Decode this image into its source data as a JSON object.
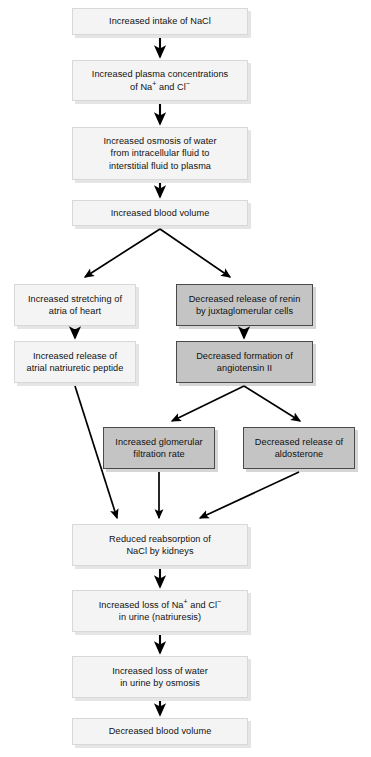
{
  "diagram": {
    "type": "flowchart",
    "canvas": {
      "width": 371,
      "height": 757
    },
    "style": {
      "light_fill": "#f4f4f4",
      "light_border": "#d8d8d8",
      "shaded_fill": "#c4c4c4",
      "shaded_border": "#4a4a4a",
      "arrow_color": "#000000",
      "text_color": "#111111",
      "background": "#ffffff"
    },
    "nodes": [
      {
        "id": "n1",
        "label": "Increased intake of NaCl",
        "shade": "light",
        "x": 72,
        "y": 8,
        "w": 176,
        "h": 27
      },
      {
        "id": "n2",
        "label": "Increased plasma concentrations\nof Na+ and Cl-",
        "shade": "light",
        "x": 72,
        "y": 60,
        "w": 176,
        "h": 41
      },
      {
        "id": "n3",
        "label": "Increased osmosis of water\nfrom intracellular fluid to\ninterstitial fluid to plasma",
        "shade": "light",
        "x": 72,
        "y": 127,
        "w": 176,
        "h": 53
      },
      {
        "id": "n4",
        "label": "Increased blood volume",
        "shade": "light",
        "x": 72,
        "y": 200,
        "w": 176,
        "h": 26
      },
      {
        "id": "n5",
        "label": "Increased stretching of\natria of heart",
        "shade": "light",
        "x": 14,
        "y": 284,
        "w": 122,
        "h": 42
      },
      {
        "id": "n6",
        "label": "Decreased release of renin\nby juxtaglomerular cells",
        "shade": "shaded",
        "x": 176,
        "y": 284,
        "w": 137,
        "h": 42
      },
      {
        "id": "n7",
        "label": "Increased release of\natrial natriuretic peptide",
        "shade": "light",
        "x": 14,
        "y": 341,
        "w": 122,
        "h": 42
      },
      {
        "id": "n8",
        "label": "Decreased formation of\nangiotensin II",
        "shade": "shaded",
        "x": 176,
        "y": 341,
        "w": 137,
        "h": 42
      },
      {
        "id": "n9",
        "label": "Increased glomerular\nfiltration rate",
        "shade": "shaded",
        "x": 103,
        "y": 427,
        "w": 112,
        "h": 42
      },
      {
        "id": "n10",
        "label": "Decreased release of\naldosterone",
        "shade": "shaded",
        "x": 243,
        "y": 427,
        "w": 112,
        "h": 42
      },
      {
        "id": "n11",
        "label": "Reduced reabsorption of\nNaCl by kidneys",
        "shade": "light",
        "x": 72,
        "y": 524,
        "w": 176,
        "h": 42
      },
      {
        "id": "n12",
        "label": "Increased loss of Na+ and Cl-\nin urine (natriuresis)",
        "shade": "light",
        "x": 72,
        "y": 590,
        "w": 176,
        "h": 42
      },
      {
        "id": "n13",
        "label": "Increased loss of water\nin urine by osmosis",
        "shade": "light",
        "x": 72,
        "y": 656,
        "w": 176,
        "h": 42
      },
      {
        "id": "n14",
        "label": "Decreased blood volume",
        "shade": "light",
        "x": 72,
        "y": 718,
        "w": 176,
        "h": 27
      }
    ],
    "edges": [
      {
        "id": "e1",
        "from": "n1",
        "to": "n2",
        "kind": "straight-down"
      },
      {
        "id": "e2",
        "from": "n2",
        "to": "n3",
        "kind": "straight-down"
      },
      {
        "id": "e3",
        "from": "n3",
        "to": "n4",
        "kind": "straight-down"
      },
      {
        "id": "e4",
        "from": "n4",
        "to": "n5",
        "kind": "diagonal-left"
      },
      {
        "id": "e5",
        "from": "n4",
        "to": "n6",
        "kind": "diagonal-right"
      },
      {
        "id": "e6",
        "from": "n5",
        "to": "n7",
        "kind": "straight-down"
      },
      {
        "id": "e7",
        "from": "n6",
        "to": "n8",
        "kind": "straight-down"
      },
      {
        "id": "e8",
        "from": "n8",
        "to": "n9",
        "kind": "diagonal-left"
      },
      {
        "id": "e9",
        "from": "n8",
        "to": "n10",
        "kind": "diagonal-right"
      },
      {
        "id": "e10",
        "from": "n7",
        "to": "n11",
        "kind": "long-diagonal-right"
      },
      {
        "id": "e11",
        "from": "n9",
        "to": "n11",
        "kind": "straight-down"
      },
      {
        "id": "e12",
        "from": "n10",
        "to": "n11",
        "kind": "long-diagonal-left"
      },
      {
        "id": "e13",
        "from": "n11",
        "to": "n12",
        "kind": "straight-down"
      },
      {
        "id": "e14",
        "from": "n12",
        "to": "n13",
        "kind": "straight-down"
      },
      {
        "id": "e15",
        "from": "n13",
        "to": "n14",
        "kind": "straight-down"
      }
    ]
  }
}
